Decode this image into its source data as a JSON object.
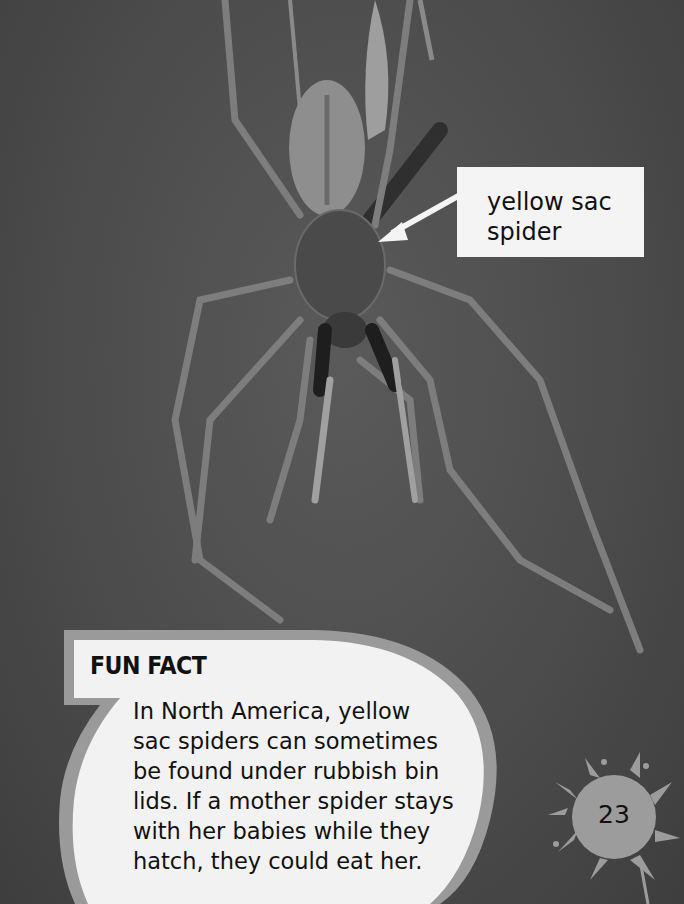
{
  "callout": {
    "label_line1": "yellow sac",
    "label_line2": "spider"
  },
  "fun_fact": {
    "title": "FUN FACT",
    "lines": [
      "In North America, yellow",
      "sac spiders can sometimes",
      "be found under rubbish bin",
      "lids. If a mother spider stays",
      "with her babies while they",
      "hatch, they could eat her."
    ]
  },
  "page_number": "23",
  "colors": {
    "background": "#4a4a4a",
    "callout_fill": "#f4f4f4",
    "bubble_fill": "#f2f2f2",
    "bubble_border": "#9a9a9a",
    "splat": "#9c9c9c",
    "text": "#111111"
  }
}
